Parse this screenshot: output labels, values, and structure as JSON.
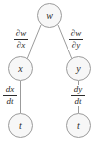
{
  "diagram": {
    "type": "tree",
    "nodes": [
      {
        "id": "w",
        "label": "w",
        "level": 0,
        "x": 49.5,
        "y": 15.5
      },
      {
        "id": "x",
        "label": "x",
        "level": 1,
        "x": 20.5,
        "y": 68.5
      },
      {
        "id": "y",
        "label": "y",
        "level": 1,
        "x": 78.5,
        "y": 68.5
      },
      {
        "id": "tl",
        "label": "t",
        "level": 2,
        "x": 20.5,
        "y": 125.5
      },
      {
        "id": "tr",
        "label": "t",
        "level": 2,
        "x": 78.5,
        "y": 125.5
      }
    ],
    "edges": [
      {
        "from": "w",
        "to": "x",
        "label_numerator": "∂w",
        "label_denominator": "∂x"
      },
      {
        "from": "w",
        "to": "y",
        "label_numerator": "∂w",
        "label_denominator": "∂y"
      },
      {
        "from": "x",
        "to": "tl",
        "label_numerator": "dx",
        "label_denominator": "dt"
      },
      {
        "from": "y",
        "to": "tr",
        "label_numerator": "dy",
        "label_denominator": "dt"
      }
    ],
    "colors": {
      "background": "#ffffff",
      "node_fill": "#f7f7f7",
      "node_stroke": "#9b9b9b",
      "edge_stroke": "#9b9b9b",
      "text": "#2b2b2b"
    }
  }
}
